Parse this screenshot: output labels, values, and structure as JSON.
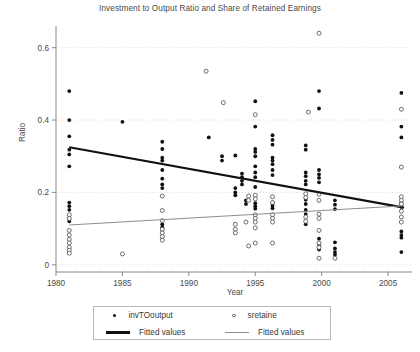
{
  "chart_data": {
    "type": "scatter",
    "title": "Investment to Output Ratio and Share of Retained Earnings",
    "xlabel": "Year",
    "ylabel": "Ratio",
    "xlim": [
      1980,
      2006.8
    ],
    "ylim": [
      -0.02,
      0.66
    ],
    "xticks": [
      1980,
      1985,
      1990,
      1995,
      2000,
      2005
    ],
    "xtick_labels": [
      "1980",
      "1985",
      "1990",
      "1995",
      "2000",
      "2005"
    ],
    "yticks": [
      0,
      0.2,
      0.4,
      0.6
    ],
    "ytick_labels": [
      "0",
      "0.2",
      "0.4",
      "0.6"
    ],
    "grid": "horizontal-dotted",
    "legend_position": "below-center",
    "series": [
      {
        "name": "invTOoutput",
        "marker": "filled-circle",
        "color": "#111111",
        "points": [
          [
            1981.0,
            0.48
          ],
          [
            1981.0,
            0.4
          ],
          [
            1981.0,
            0.355
          ],
          [
            1981.0,
            0.318
          ],
          [
            1981.0,
            0.305
          ],
          [
            1981.0,
            0.272
          ],
          [
            1981.0,
            0.172
          ],
          [
            1981.0,
            0.162
          ],
          [
            1981.0,
            0.152
          ],
          [
            1981.0,
            0.128
          ],
          [
            1981.0,
            0.12
          ],
          [
            1985.0,
            0.395
          ],
          [
            1988.0,
            0.34
          ],
          [
            1988.0,
            0.32
          ],
          [
            1988.0,
            0.296
          ],
          [
            1988.0,
            0.288
          ],
          [
            1988.0,
            0.262
          ],
          [
            1988.0,
            0.238
          ],
          [
            1988.0,
            0.222
          ],
          [
            1988.0,
            0.212
          ],
          [
            1988.0,
            0.112
          ],
          [
            1988.0,
            0.104
          ],
          [
            1988.0,
            0.096
          ],
          [
            1991.5,
            0.352
          ],
          [
            1992.5,
            0.3
          ],
          [
            1992.5,
            0.288
          ],
          [
            1993.5,
            0.302
          ],
          [
            1993.5,
            0.212
          ],
          [
            1993.5,
            0.2
          ],
          [
            1993.5,
            0.192
          ],
          [
            1994.0,
            0.252
          ],
          [
            1994.0,
            0.242
          ],
          [
            1994.0,
            0.232
          ],
          [
            1994.0,
            0.222
          ],
          [
            1994.3,
            0.178
          ],
          [
            1994.3,
            0.168
          ],
          [
            1995.0,
            0.452
          ],
          [
            1995.0,
            0.382
          ],
          [
            1995.0,
            0.32
          ],
          [
            1995.0,
            0.312
          ],
          [
            1995.0,
            0.3
          ],
          [
            1995.0,
            0.272
          ],
          [
            1995.0,
            0.255
          ],
          [
            1995.0,
            0.242
          ],
          [
            1995.0,
            0.215
          ],
          [
            1995.0,
            0.17
          ],
          [
            1995.0,
            0.162
          ],
          [
            1995.0,
            0.155
          ],
          [
            1996.3,
            0.358
          ],
          [
            1996.3,
            0.345
          ],
          [
            1996.3,
            0.332
          ],
          [
            1996.3,
            0.296
          ],
          [
            1996.3,
            0.288
          ],
          [
            1996.3,
            0.278
          ],
          [
            1996.3,
            0.262
          ],
          [
            1996.3,
            0.248
          ],
          [
            1996.3,
            0.172
          ],
          [
            1996.3,
            0.164
          ],
          [
            1996.3,
            0.156
          ],
          [
            1998.8,
            0.33
          ],
          [
            1998.8,
            0.318
          ],
          [
            1998.8,
            0.255
          ],
          [
            1998.8,
            0.245
          ],
          [
            1998.8,
            0.232
          ],
          [
            1998.8,
            0.222
          ],
          [
            1998.8,
            0.18
          ],
          [
            1998.8,
            0.168
          ],
          [
            1998.8,
            0.152
          ],
          [
            1998.8,
            0.14
          ],
          [
            1998.8,
            0.112
          ],
          [
            1999.8,
            0.48
          ],
          [
            1999.8,
            0.432
          ],
          [
            1999.8,
            0.262
          ],
          [
            1999.8,
            0.25
          ],
          [
            1999.8,
            0.24
          ],
          [
            1999.8,
            0.228
          ],
          [
            1999.8,
            0.072
          ],
          [
            1999.8,
            0.055
          ],
          [
            1999.8,
            0.042
          ],
          [
            2001.0,
            0.178
          ],
          [
            2001.0,
            0.166
          ],
          [
            2001.0,
            0.154
          ],
          [
            2001.0,
            0.062
          ],
          [
            2001.0,
            0.045
          ],
          [
            2001.0,
            0.035
          ],
          [
            2001.0,
            0.028
          ],
          [
            2006.0,
            0.475
          ],
          [
            2006.0,
            0.382
          ],
          [
            2006.0,
            0.352
          ],
          [
            2006.0,
            0.172
          ],
          [
            2006.0,
            0.16
          ],
          [
            2006.0,
            0.092
          ],
          [
            2006.0,
            0.082
          ],
          [
            2006.0,
            0.075
          ],
          [
            2006.0,
            0.035
          ]
        ]
      },
      {
        "name": "sretaine",
        "marker": "open-circle",
        "color": "#555555",
        "points": [
          [
            1981.0,
            0.138
          ],
          [
            1981.0,
            0.128
          ],
          [
            1981.0,
            0.095
          ],
          [
            1981.0,
            0.082
          ],
          [
            1981.0,
            0.07
          ],
          [
            1981.0,
            0.06
          ],
          [
            1981.0,
            0.048
          ],
          [
            1981.0,
            0.04
          ],
          [
            1981.0,
            0.032
          ],
          [
            1985.0,
            0.03
          ],
          [
            1988.0,
            0.19
          ],
          [
            1988.0,
            0.15
          ],
          [
            1988.0,
            0.122
          ],
          [
            1988.0,
            0.098
          ],
          [
            1988.0,
            0.088
          ],
          [
            1988.0,
            0.078
          ],
          [
            1988.0,
            0.068
          ],
          [
            1991.3,
            0.535
          ],
          [
            1992.6,
            0.448
          ],
          [
            1993.5,
            0.112
          ],
          [
            1993.5,
            0.098
          ],
          [
            1993.5,
            0.088
          ],
          [
            1994.3,
            0.118
          ],
          [
            1994.5,
            0.19
          ],
          [
            1994.5,
            0.178
          ],
          [
            1994.5,
            0.052
          ],
          [
            1995.0,
            0.415
          ],
          [
            1995.0,
            0.192
          ],
          [
            1995.0,
            0.182
          ],
          [
            1995.0,
            0.138
          ],
          [
            1995.0,
            0.128
          ],
          [
            1995.0,
            0.118
          ],
          [
            1995.0,
            0.102
          ],
          [
            1995.0,
            0.06
          ],
          [
            1996.3,
            0.188
          ],
          [
            1996.3,
            0.172
          ],
          [
            1996.3,
            0.138
          ],
          [
            1996.3,
            0.128
          ],
          [
            1996.3,
            0.118
          ],
          [
            1996.3,
            0.06
          ],
          [
            1998.8,
            0.196
          ],
          [
            1998.8,
            0.186
          ],
          [
            1998.8,
            0.132
          ],
          [
            1998.8,
            0.12
          ],
          [
            1999.0,
            0.422
          ],
          [
            1999.8,
            0.64
          ],
          [
            1999.8,
            0.195
          ],
          [
            1999.8,
            0.178
          ],
          [
            1999.8,
            0.14
          ],
          [
            1999.8,
            0.128
          ],
          [
            1999.8,
            0.095
          ],
          [
            1999.8,
            0.06
          ],
          [
            1999.8,
            0.048
          ],
          [
            1999.8,
            0.018
          ],
          [
            2001.0,
            0.018
          ],
          [
            2006.0,
            0.43
          ],
          [
            2006.0,
            0.27
          ],
          [
            2006.0,
            0.188
          ],
          [
            2006.0,
            0.178
          ],
          [
            2006.0,
            0.168
          ],
          [
            2006.0,
            0.148
          ],
          [
            2006.0,
            0.132
          ],
          [
            2006.0,
            0.118
          ]
        ]
      }
    ],
    "fits": [
      {
        "name": "Fitted values",
        "for": "invTOoutput",
        "style": "thick",
        "color": "#111111",
        "x": [
          1981.0,
          2006.2
        ],
        "y": [
          0.325,
          0.158
        ]
      },
      {
        "name": "Fitted values",
        "for": "sretaine",
        "style": "thin",
        "color": "#8e8e8e",
        "x": [
          1981.0,
          2006.2
        ],
        "y": [
          0.11,
          0.163
        ]
      }
    ]
  },
  "legend": {
    "entries": [
      {
        "label": "invTOoutput",
        "marker": "filled-circle"
      },
      {
        "label": "sretaine",
        "marker": "open-circle"
      },
      {
        "label": "Fitted values",
        "marker": "thick-line"
      },
      {
        "label": "Fitted values",
        "marker": "thin-line"
      }
    ]
  }
}
